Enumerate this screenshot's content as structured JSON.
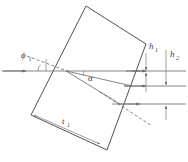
{
  "figure": {
    "kind": "optics-ray-diagram",
    "background_color": "#ffffff",
    "line_color": "#555a5e",
    "ray_color": "#6a6f73",
    "label_color": "#3c4044"
  },
  "labels": {
    "incidence_angle": {
      "symbol": "ϕ",
      "subscript": "1",
      "name": "phi-one"
    },
    "refraction_angle": {
      "symbol": "α",
      "subscript": "",
      "name": "alpha"
    },
    "offset_one": {
      "symbol": "h",
      "subscript": "1",
      "name": "h-one"
    },
    "offset_two": {
      "symbol": "h",
      "subscript": "2",
      "name": "h-two"
    },
    "thickness": {
      "symbol": "t",
      "subscript": "1",
      "name": "t-one"
    }
  },
  "geometry": {
    "plate": {
      "name": "tilted-plate",
      "points": "86,6 146,44 107,150 31,115"
    },
    "optical_axis": {
      "y": 71,
      "x_start": 2,
      "x_end": 186
    },
    "rays": [
      {
        "name": "incident-ray",
        "x1": 2,
        "y1": 71,
        "x2": 66,
        "y2": 71
      },
      {
        "name": "exit-ray-upper",
        "x1": 138,
        "y1": 71,
        "x2": 186,
        "y2": 71
      },
      {
        "name": "exit-ray-middle",
        "x1": 120,
        "y1": 86,
        "x2": 186,
        "y2": 86
      },
      {
        "name": "exit-ray-lower",
        "x1": 112,
        "y1": 104,
        "x2": 186,
        "y2": 104
      }
    ],
    "refracted_ray": {
      "name": "refracted-ray",
      "x1": 66,
      "y1": 71,
      "x2": 126,
      "y2": 86
    },
    "internal_ray": {
      "name": "internal-ray-lower",
      "x1": 66,
      "y1": 71,
      "x2": 118,
      "y2": 104
    },
    "dashed_extension": {
      "name": "dashed-extension",
      "x1": 66,
      "y1": 71,
      "x2": 150,
      "y2": 124
    },
    "dashed_normal": {
      "name": "dashed-normal-line",
      "x1": 24,
      "y1": 56,
      "x2": 72,
      "y2": 73
    },
    "h1_marker": {
      "name": "h1-dimension",
      "x": 146,
      "y_top": 55,
      "y_bottom": 70
    },
    "h2_marker": {
      "name": "h2-dimension",
      "x": 166,
      "y_top": 52,
      "y_bottom": 70
    },
    "h1_lower_marker": {
      "name": "h1-lower-dimension",
      "x": 146,
      "y_top": 74,
      "y_bottom": 86
    },
    "h2_lower_marker": {
      "name": "h2-lower-dimension",
      "x": 166,
      "y_top": 88,
      "y_bottom": 104
    },
    "thickness_dimension": {
      "name": "t1-dimension",
      "x1": 33,
      "y1": 114,
      "x2": 101,
      "y2": 145
    }
  }
}
